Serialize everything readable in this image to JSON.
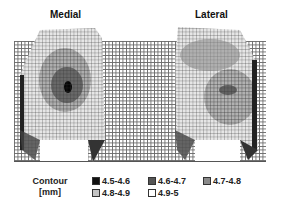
{
  "figure": {
    "panels": [
      {
        "title": "Medial"
      },
      {
        "title": "Lateral"
      }
    ],
    "legend": {
      "label_line1": "Contour",
      "label_line2": "[mm]",
      "items": [
        {
          "range": "4.5-4.6",
          "color": "#111111"
        },
        {
          "range": "4.6-4.7",
          "color": "#555555"
        },
        {
          "range": "4.7-4.8",
          "color": "#8a8a8a"
        },
        {
          "range": "4.8-4.9",
          "color": "#c4c4c4"
        },
        {
          "range": "4.9-5",
          "color": "#ffffff"
        }
      ]
    }
  }
}
